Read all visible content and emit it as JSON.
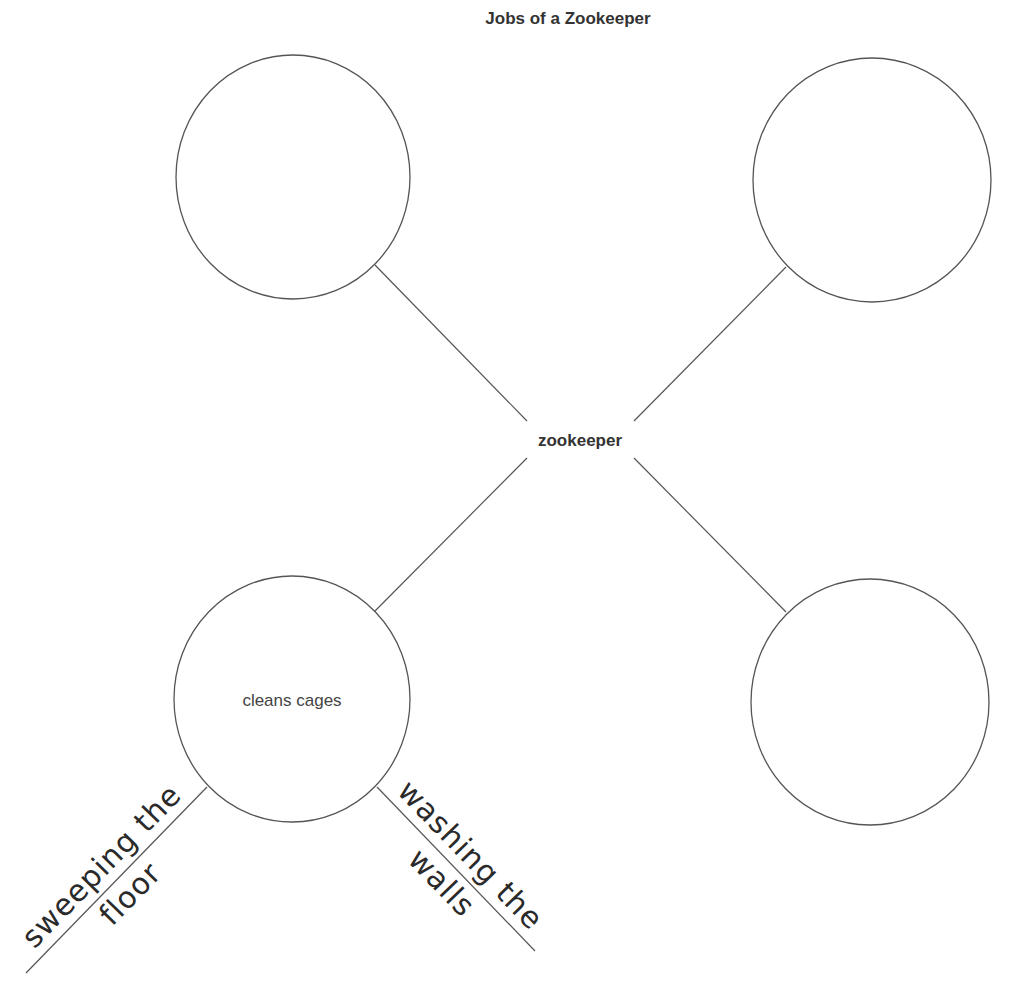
{
  "title": "Jobs of a Zookeeper",
  "center": {
    "label": "zookeeper"
  },
  "nodes": [
    {
      "position": "top-left",
      "label": ""
    },
    {
      "position": "top-right",
      "label": ""
    },
    {
      "position": "bottom-left",
      "label": "cleans cages"
    },
    {
      "position": "bottom-right",
      "label": ""
    }
  ],
  "sub_branches": [
    {
      "parent": "cleans cages",
      "line1": "sweeping the",
      "line2": "floor"
    },
    {
      "parent": "cleans cages",
      "line1": "washing the",
      "line2": "walls"
    }
  ],
  "colors": {
    "stroke": "#555555",
    "text": "#333333",
    "background": "#ffffff"
  }
}
